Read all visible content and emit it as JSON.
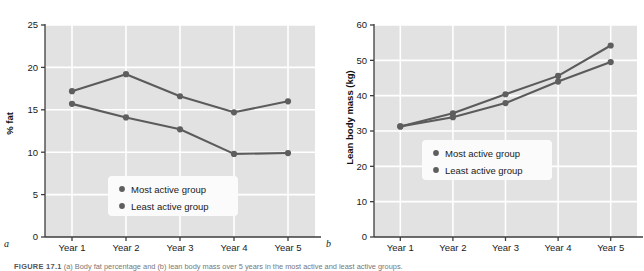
{
  "figure": {
    "panel_a_label": "a",
    "panel_b_label": "b",
    "caption_prefix": "FIGURE 17.1",
    "caption_text": "  (a) Body fat percentage and (b) lean body mass over 5 years in the most active and least active groups."
  },
  "colors": {
    "plot_background": "#e2e2e2",
    "gridline": "#ffffff",
    "axis": "#3d3d3d",
    "series_line": "#5b5b5b",
    "marker": "#5e5e5e",
    "legend_background": "#fbfbfb",
    "text": "#1a1a1a"
  },
  "legend": {
    "position": "inside-bottom-center",
    "entries": [
      {
        "label": "Most active group",
        "marker": "filled-circle"
      },
      {
        "label": "Least active group",
        "marker": "filled-circle"
      }
    ]
  },
  "chart_data": [
    {
      "panel": "a",
      "type": "line",
      "title": "",
      "xlabel": "",
      "ylabel": "% fat",
      "categories": [
        "Year 1",
        "Year 2",
        "Year 3",
        "Year 4",
        "Year 5"
      ],
      "ylim": [
        0,
        25
      ],
      "yticks": [
        0,
        5,
        10,
        15,
        20,
        25
      ],
      "ytick_labels": [
        "0",
        "5",
        "10",
        "15",
        "20",
        "25"
      ],
      "grid": true,
      "series": [
        {
          "name": "Most active group",
          "values": [
            17.2,
            19.2,
            16.6,
            14.7,
            16.0
          ]
        },
        {
          "name": "Least active group",
          "values": [
            15.7,
            14.1,
            12.7,
            9.8,
            9.9
          ]
        }
      ]
    },
    {
      "panel": "b",
      "type": "line",
      "title": "",
      "xlabel": "",
      "ylabel": "Lean body mass (kg)",
      "categories": [
        "Year 1",
        "Year 2",
        "Year 3",
        "Year 4",
        "Year 5"
      ],
      "ylim": [
        0,
        60
      ],
      "yticks": [
        0,
        10,
        20,
        30,
        40,
        50,
        60
      ],
      "ytick_labels": [
        "0",
        "10",
        "20",
        "30",
        "40",
        "50",
        "60"
      ],
      "grid": true,
      "series": [
        {
          "name": "Most active group",
          "values": [
            31.3,
            35.0,
            40.4,
            45.6,
            54.2
          ]
        },
        {
          "name": "Least active group",
          "values": [
            31.3,
            33.9,
            37.9,
            44.0,
            49.5
          ]
        }
      ]
    }
  ]
}
